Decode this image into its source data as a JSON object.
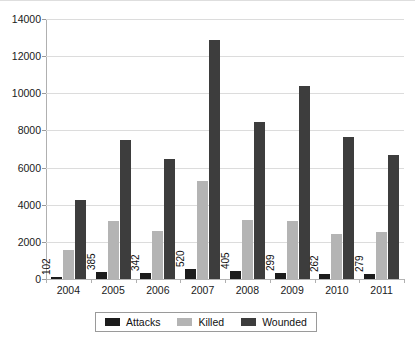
{
  "chart_data": {
    "type": "bar",
    "title": "",
    "subtitle": "",
    "xlabel": "",
    "ylabel": "",
    "categories": [
      "2004",
      "2005",
      "2006",
      "2007",
      "2008",
      "2009",
      "2010",
      "2011"
    ],
    "series": [
      {
        "name": "Attacks",
        "color": "#1c1c1c",
        "values": [
          102,
          385,
          342,
          520,
          405,
          299,
          262,
          279
        ],
        "labels": [
          "102",
          "385",
          "342",
          "520",
          "405",
          "299",
          "262",
          "279"
        ],
        "labels_shown": true
      },
      {
        "name": "Killed",
        "color": "#b4b4b4",
        "values": [
          1550,
          3100,
          2600,
          5300,
          3200,
          3100,
          2450,
          2550
        ],
        "labels_shown": false
      },
      {
        "name": "Wounded",
        "color": "#3d3d3d",
        "values": [
          4250,
          7500,
          6450,
          12850,
          8450,
          10400,
          7650,
          6700
        ],
        "labels_shown": false
      }
    ],
    "ylim": [
      0,
      14000
    ],
    "yticks": [
      0,
      2000,
      4000,
      6000,
      8000,
      10000,
      12000,
      14000
    ],
    "ytick_labels": [
      "0",
      "2000",
      "4000",
      "6000",
      "8000",
      "10000",
      "12000",
      "14000"
    ],
    "grid": true,
    "legend_position": "bottom"
  },
  "legend": {
    "items": [
      {
        "label": "Attacks",
        "swatch": "attacks"
      },
      {
        "label": "Killed",
        "swatch": "killed"
      },
      {
        "label": "Wounded",
        "swatch": "wounded"
      }
    ]
  },
  "colors": {
    "attacks": "#1c1c1c",
    "killed": "#b4b4b4",
    "wounded": "#3d3d3d",
    "gridline": "#dcdcdc",
    "axis": "#b0b0b0",
    "background": "#ffffff"
  }
}
